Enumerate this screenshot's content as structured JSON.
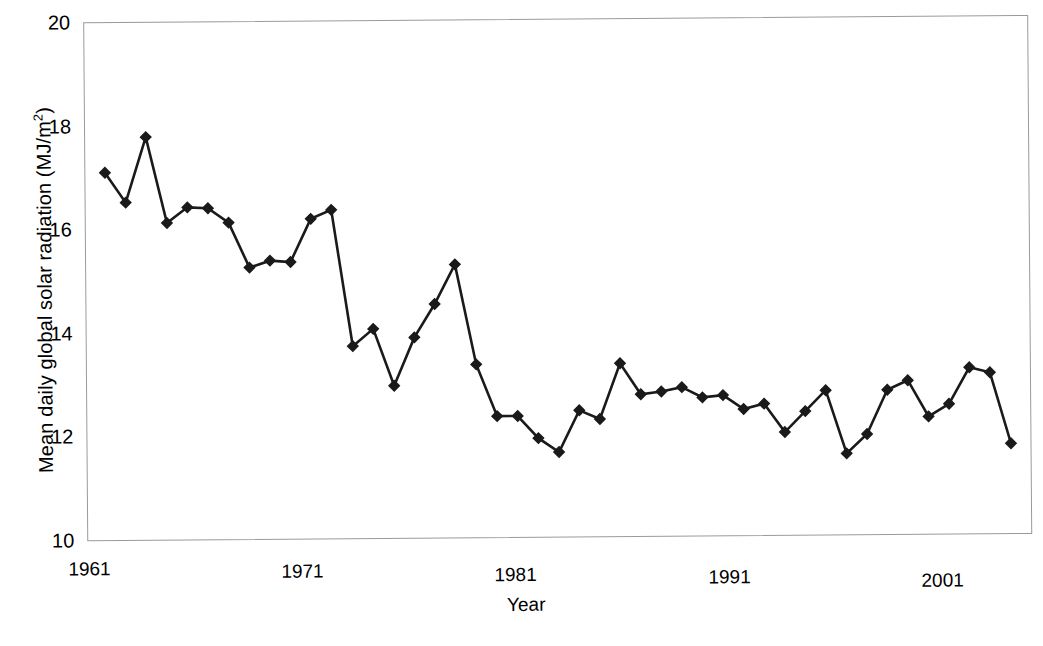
{
  "chart_data": {
    "type": "line",
    "title": "",
    "xlabel": "Year",
    "ylabel": "Mean daily global solar radiation (MJ/m2)",
    "ylabel_html": "Mean daily global solar radiation (MJ/m<sup>2</sup>)",
    "xlim": [
      1960,
      2006
    ],
    "ylim": [
      10,
      20
    ],
    "xticks": [
      1961,
      1971,
      1981,
      1991,
      2001
    ],
    "xtick_labels": [
      "1961",
      "1971",
      "1981",
      "1991",
      "2001"
    ],
    "yticks": [
      10,
      12,
      14,
      16,
      18,
      20
    ],
    "ytick_labels": [
      "10",
      "12",
      "14",
      "16",
      "18",
      "20"
    ],
    "grid": false,
    "legend": "none",
    "marker": "diamond",
    "marker_color": "#1a1a1a",
    "line_color": "#1a1a1a",
    "series": [
      {
        "name": "Mean daily global solar radiation",
        "x": [
          1961,
          1962,
          1963,
          1964,
          1965,
          1966,
          1967,
          1968,
          1969,
          1970,
          1971,
          1972,
          1973,
          1974,
          1975,
          1976,
          1977,
          1978,
          1979,
          1980,
          1981,
          1982,
          1983,
          1984,
          1985,
          1986,
          1987,
          1988,
          1989,
          1990,
          1991,
          1992,
          1993,
          1994,
          1995,
          1996,
          1997,
          1998,
          1999,
          2000,
          2001,
          2002,
          2003,
          2004,
          2005
        ],
        "values": [
          17.1,
          16.52,
          17.78,
          16.12,
          16.42,
          16.4,
          16.12,
          15.25,
          15.38,
          15.35,
          16.18,
          16.35,
          13.72,
          14.05,
          12.95,
          13.88,
          14.52,
          15.28,
          13.35,
          12.35,
          12.35,
          11.92,
          11.65,
          12.45,
          12.28,
          13.35,
          12.75,
          12.8,
          12.88,
          12.68,
          12.72,
          12.45,
          12.55,
          12.0,
          12.4,
          12.8,
          11.58,
          11.95,
          12.8,
          12.98,
          12.28,
          12.52,
          13.22,
          13.12,
          11.75
        ]
      }
    ]
  },
  "axis": {
    "y_title": "Mean daily global solar radiation (MJ/m",
    "y_title_sup": "2",
    "y_title_close": ")",
    "x_title": "Year"
  }
}
